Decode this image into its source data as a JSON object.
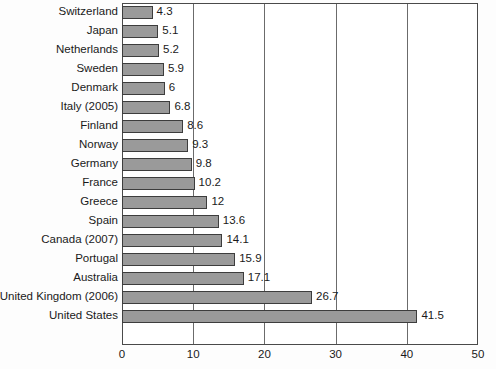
{
  "chart_data": {
    "type": "bar",
    "orientation": "horizontal",
    "title": "",
    "subtitle": "",
    "xlabel": "",
    "ylabel": "",
    "xlim": [
      0,
      50
    ],
    "xticks": [
      0,
      10,
      20,
      30,
      40,
      50
    ],
    "grid": true,
    "gridlines_axis": "x",
    "legend": false,
    "legend_position": "none",
    "bar_color": "#9a9a9a",
    "bar_edge_color": "#3d3d3d",
    "axis_color": "#4a4a4a",
    "background_color": "#ffffff",
    "categories": [
      "Switzerland",
      "Japan",
      "Netherlands",
      "Sweden",
      "Denmark",
      "Italy (2005)",
      "Finland",
      "Norway",
      "Germany",
      "France",
      "Greece",
      "Spain",
      "Canada (2007)",
      "Portugal",
      "Australia",
      "United Kingdom (2006)",
      "United States"
    ],
    "values": [
      4.3,
      5.1,
      5.2,
      5.9,
      6,
      6.8,
      8.6,
      9.3,
      9.8,
      10.2,
      12,
      13.6,
      14.1,
      15.9,
      17.1,
      26.7,
      41.5
    ],
    "value_labels": [
      "4.3",
      "5.1",
      "5.2",
      "5.9",
      "6",
      "6.8",
      "8.6",
      "9.3",
      "9.8",
      "10.2",
      "12",
      "13.6",
      "14.1",
      "15.9",
      "17.1",
      "26.7",
      "41.5"
    ],
    "tick_labels": [
      "0",
      "10",
      "20",
      "30",
      "40",
      "50"
    ]
  }
}
